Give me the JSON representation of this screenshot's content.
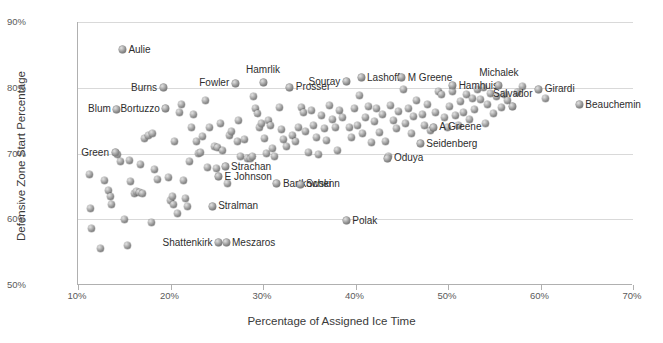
{
  "chart_data": {
    "type": "scatter",
    "title": "",
    "xlabel": "Percentage of Assigned Ice Time",
    "ylabel": "Defensive Zone Start Percentage",
    "xlim": [
      10,
      70
    ],
    "ylim": [
      50,
      90
    ],
    "xticks": [
      "10%",
      "20%",
      "30%",
      "40%",
      "50%",
      "60%",
      "70%"
    ],
    "yticks": [
      "50%",
      "60%",
      "70%",
      "80%",
      "90%"
    ],
    "xtick_values": [
      10,
      20,
      30,
      40,
      50,
      60,
      70
    ],
    "ytick_values": [
      50,
      60,
      70,
      80,
      90
    ],
    "grid": "horizontal",
    "legend": "none",
    "marker_style": "grey-3d-sphere",
    "labeled_points": [
      {
        "name": "Aulie",
        "x": 14.8,
        "y": 85.8,
        "anchor": "l"
      },
      {
        "name": "Burns",
        "x": 19.2,
        "y": 80.0,
        "anchor": "r"
      },
      {
        "name": "Blum",
        "x": 14.2,
        "y": 76.7,
        "anchor": "r"
      },
      {
        "name": "Bortuzzo",
        "x": 19.5,
        "y": 76.8,
        "anchor": "r"
      },
      {
        "name": "Fowler",
        "x": 27.0,
        "y": 80.7,
        "anchor": "r"
      },
      {
        "name": "Hamrlik",
        "x": 30.0,
        "y": 80.8,
        "anchor": "t"
      },
      {
        "name": "Prosser",
        "x": 32.9,
        "y": 80.1,
        "anchor": "l"
      },
      {
        "name": "Souray",
        "x": 39.0,
        "y": 80.9,
        "anchor": "r"
      },
      {
        "name": "Lashoff",
        "x": 40.6,
        "y": 81.5,
        "anchor": "l"
      },
      {
        "name": "M Greene",
        "x": 45.0,
        "y": 81.5,
        "anchor": "l"
      },
      {
        "name": "Hamhuis",
        "x": 50.5,
        "y": 80.3,
        "anchor": "l"
      },
      {
        "name": "Michalek",
        "x": 55.5,
        "y": 80.4,
        "anchor": "t"
      },
      {
        "name": "Girardi",
        "x": 59.8,
        "y": 79.8,
        "anchor": "l"
      },
      {
        "name": "Beauchemin",
        "x": 64.2,
        "y": 77.4,
        "anchor": "l"
      },
      {
        "name": "Salvador",
        "x": 57.0,
        "y": 77.2,
        "anchor": "t"
      },
      {
        "name": "A Greene",
        "x": 48.4,
        "y": 74.0,
        "anchor": "l"
      },
      {
        "name": "Seidenberg",
        "x": 47.0,
        "y": 71.5,
        "anchor": "l"
      },
      {
        "name": "Oduya",
        "x": 43.5,
        "y": 69.3,
        "anchor": "l"
      },
      {
        "name": "Green",
        "x": 14.0,
        "y": 70.1,
        "anchor": "r"
      },
      {
        "name": "Strachan",
        "x": 25.9,
        "y": 68.0,
        "anchor": "l"
      },
      {
        "name": "E Johnson",
        "x": 25.2,
        "y": 66.5,
        "anchor": "l"
      },
      {
        "name": "Bartkowski",
        "x": 31.5,
        "y": 65.4,
        "anchor": "l"
      },
      {
        "name": "Schenn",
        "x": 34.0,
        "y": 65.3,
        "anchor": "l"
      },
      {
        "name": "Stralman",
        "x": 24.5,
        "y": 62.0,
        "anchor": "l"
      },
      {
        "name": "Shattenkirk",
        "x": 25.2,
        "y": 56.4,
        "anchor": "r"
      },
      {
        "name": "Meszaros",
        "x": 26.0,
        "y": 56.4,
        "anchor": "l"
      },
      {
        "name": "Polak",
        "x": 39.0,
        "y": 59.8,
        "anchor": "l"
      }
    ],
    "points": [
      [
        11.2,
        66.8
      ],
      [
        11.3,
        61.6
      ],
      [
        11.5,
        58.6
      ],
      [
        12.4,
        55.5
      ],
      [
        12.9,
        65.9
      ],
      [
        13.3,
        64.3
      ],
      [
        13.5,
        63.5
      ],
      [
        13.6,
        62.2
      ],
      [
        14.0,
        70.1
      ],
      [
        14.2,
        76.7
      ],
      [
        14.3,
        69.9
      ],
      [
        14.6,
        68.8
      ],
      [
        14.8,
        85.8
      ],
      [
        15.0,
        60.0
      ],
      [
        15.3,
        56.0
      ],
      [
        15.6,
        68.9
      ],
      [
        15.7,
        65.8
      ],
      [
        16.1,
        63.9
      ],
      [
        16.3,
        64.2
      ],
      [
        16.6,
        64.1
      ],
      [
        16.8,
        68.4
      ],
      [
        17.0,
        63.9
      ],
      [
        17.2,
        72.3
      ],
      [
        17.6,
        72.7
      ],
      [
        17.9,
        59.5
      ],
      [
        18.1,
        73.0
      ],
      [
        18.3,
        67.5
      ],
      [
        18.6,
        66.0
      ],
      [
        19.2,
        80.0
      ],
      [
        19.5,
        76.8
      ],
      [
        19.8,
        66.4
      ],
      [
        20.0,
        62.9
      ],
      [
        20.2,
        63.4
      ],
      [
        20.3,
        62.2
      ],
      [
        20.4,
        71.8
      ],
      [
        20.8,
        60.8
      ],
      [
        21.0,
        76.3
      ],
      [
        21.2,
        77.5
      ],
      [
        21.4,
        65.9
      ],
      [
        21.6,
        63.1
      ],
      [
        21.8,
        61.9
      ],
      [
        22.0,
        68.8
      ],
      [
        22.3,
        74.0
      ],
      [
        22.5,
        76.0
      ],
      [
        22.8,
        71.9
      ],
      [
        23.0,
        70.0
      ],
      [
        23.2,
        70.1
      ],
      [
        23.5,
        72.6
      ],
      [
        23.8,
        78.0
      ],
      [
        24.0,
        67.8
      ],
      [
        24.2,
        73.9
      ],
      [
        24.5,
        62.0
      ],
      [
        24.8,
        71.0
      ],
      [
        25.0,
        67.7
      ],
      [
        25.1,
        70.9
      ],
      [
        25.2,
        66.5
      ],
      [
        25.2,
        56.4
      ],
      [
        25.4,
        74.6
      ],
      [
        25.6,
        70.5
      ],
      [
        25.9,
        68.0
      ],
      [
        26.0,
        56.4
      ],
      [
        26.2,
        65.4
      ],
      [
        26.4,
        72.7
      ],
      [
        26.6,
        73.4
      ],
      [
        27.0,
        80.7
      ],
      [
        27.2,
        71.8
      ],
      [
        27.4,
        75.0
      ],
      [
        27.6,
        69.5
      ],
      [
        28.0,
        72.2
      ],
      [
        28.3,
        69.3
      ],
      [
        28.6,
        69.2
      ],
      [
        28.9,
        69.6
      ],
      [
        29.0,
        78.7
      ],
      [
        29.2,
        76.8
      ],
      [
        29.4,
        76.1
      ],
      [
        29.6,
        73.9
      ],
      [
        29.8,
        74.5
      ],
      [
        30.0,
        80.8
      ],
      [
        30.2,
        72.3
      ],
      [
        30.4,
        70.0
      ],
      [
        30.6,
        75.0
      ],
      [
        30.8,
        74.2
      ],
      [
        31.0,
        70.8
      ],
      [
        31.2,
        69.6
      ],
      [
        31.5,
        65.4
      ],
      [
        31.8,
        77.0
      ],
      [
        32.0,
        73.7
      ],
      [
        32.2,
        72.1
      ],
      [
        32.5,
        71.1
      ],
      [
        32.9,
        80.1
      ],
      [
        33.2,
        72.8
      ],
      [
        33.5,
        71.9
      ],
      [
        33.8,
        74.0
      ],
      [
        34.0,
        65.3
      ],
      [
        34.2,
        77.0
      ],
      [
        34.4,
        76.2
      ],
      [
        34.6,
        73.4
      ],
      [
        34.9,
        70.2
      ],
      [
        35.2,
        76.5
      ],
      [
        35.5,
        74.3
      ],
      [
        35.8,
        72.4
      ],
      [
        36.0,
        69.9
      ],
      [
        36.3,
        75.8
      ],
      [
        36.6,
        73.8
      ],
      [
        36.9,
        72.0
      ],
      [
        37.2,
        77.3
      ],
      [
        37.5,
        75.2
      ],
      [
        37.8,
        74.0
      ],
      [
        38.0,
        70.5
      ],
      [
        38.3,
        76.6
      ],
      [
        38.6,
        75.4
      ],
      [
        39.0,
        80.9
      ],
      [
        39.0,
        59.8
      ],
      [
        39.3,
        73.9
      ],
      [
        39.6,
        72.5
      ],
      [
        39.9,
        76.8
      ],
      [
        40.2,
        74.3
      ],
      [
        40.4,
        78.8
      ],
      [
        40.6,
        81.5
      ],
      [
        40.8,
        73.1
      ],
      [
        41.1,
        75.4
      ],
      [
        41.4,
        77.2
      ],
      [
        41.7,
        71.6
      ],
      [
        42.0,
        74.8
      ],
      [
        42.3,
        76.9
      ],
      [
        42.6,
        73.2
      ],
      [
        42.9,
        75.9
      ],
      [
        43.2,
        71.9
      ],
      [
        43.5,
        69.3
      ],
      [
        43.6,
        69.6
      ],
      [
        43.8,
        77.3
      ],
      [
        44.1,
        75.0
      ],
      [
        44.4,
        73.8
      ],
      [
        44.7,
        76.4
      ],
      [
        45.0,
        81.5
      ],
      [
        45.2,
        79.7
      ],
      [
        45.4,
        74.5
      ],
      [
        45.7,
        76.8
      ],
      [
        46.0,
        73.1
      ],
      [
        46.3,
        75.7
      ],
      [
        46.6,
        78.1
      ],
      [
        47.0,
        71.5
      ],
      [
        47.2,
        76.0
      ],
      [
        47.5,
        74.2
      ],
      [
        47.8,
        77.5
      ],
      [
        48.1,
        73.5
      ],
      [
        48.4,
        74.0
      ],
      [
        48.7,
        76.3
      ],
      [
        49.0,
        79.4
      ],
      [
        49.3,
        78.9
      ],
      [
        49.6,
        75.4
      ],
      [
        49.9,
        73.9
      ],
      [
        50.2,
        77.1
      ],
      [
        50.5,
        80.3
      ],
      [
        50.5,
        79.5
      ],
      [
        50.8,
        75.8
      ],
      [
        51.1,
        74.3
      ],
      [
        51.4,
        77.9
      ],
      [
        51.7,
        76.2
      ],
      [
        52.0,
        79.0
      ],
      [
        52.3,
        75.1
      ],
      [
        52.6,
        78.3
      ],
      [
        52.9,
        76.7
      ],
      [
        53.2,
        79.8
      ],
      [
        53.5,
        78.2
      ],
      [
        53.8,
        80.0
      ],
      [
        54.0,
        74.6
      ],
      [
        54.3,
        77.4
      ],
      [
        54.6,
        79.2
      ],
      [
        54.9,
        76.1
      ],
      [
        55.2,
        78.6
      ],
      [
        55.5,
        80.4
      ],
      [
        55.8,
        77.0
      ],
      [
        56.1,
        79.0
      ],
      [
        56.4,
        78.1
      ],
      [
        57.0,
        77.2
      ],
      [
        57.5,
        79.3
      ],
      [
        58.0,
        80.2
      ],
      [
        59.8,
        79.8
      ],
      [
        60.5,
        78.4
      ],
      [
        64.2,
        77.4
      ]
    ]
  }
}
